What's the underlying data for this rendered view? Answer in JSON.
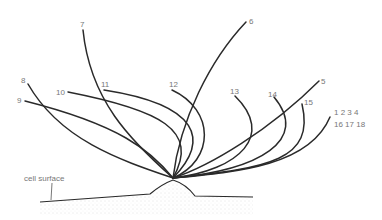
{
  "diagram": {
    "surface_label": "cell surface",
    "colors": {
      "line": "#2a2a2a",
      "label": "#777777",
      "stipple": "#bdbdbd"
    },
    "filaments": [
      {
        "label": "1 2 3 4",
        "label2": "16 17 18"
      },
      {
        "label": "5"
      },
      {
        "label": "6"
      },
      {
        "label": "7"
      },
      {
        "label": "8"
      },
      {
        "label": "9"
      },
      {
        "label": "10"
      },
      {
        "label": "11"
      },
      {
        "label": "12"
      },
      {
        "label": "13"
      },
      {
        "label": "14"
      },
      {
        "label": "15"
      }
    ]
  }
}
